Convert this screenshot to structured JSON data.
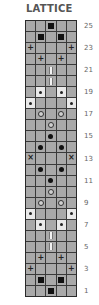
{
  "title": "LATTICE",
  "chart_data": {
    "type": "table",
    "title": "LATTICE",
    "columns": 5,
    "rows": 25,
    "row_order": "top-to-bottom from row 25 to row 1",
    "legend": {
      "square": "filled black square",
      "dot": "small dot on light cell",
      "bigdot": "large black dot",
      "ring": "hollow circle",
      "bar": "vertical bar",
      "plus": "+",
      "cross": "×"
    },
    "grid": [
      {
        "row": 25,
        "cells": [
          "",
          "",
          "square",
          "",
          ""
        ]
      },
      {
        "row": 24,
        "cells": [
          "",
          "square",
          "",
          "square",
          ""
        ]
      },
      {
        "row": 23,
        "cells": [
          "plus",
          "",
          "",
          "",
          "plus"
        ]
      },
      {
        "row": 22,
        "cells": [
          "",
          "plus",
          "",
          "plus",
          ""
        ]
      },
      {
        "row": 21,
        "cells": [
          "",
          "",
          "bar",
          "",
          ""
        ]
      },
      {
        "row": 20,
        "cells": [
          "",
          "",
          "bar",
          "",
          ""
        ]
      },
      {
        "row": 19,
        "cells": [
          "",
          "dot",
          "",
          "dot",
          ""
        ]
      },
      {
        "row": 18,
        "cells": [
          "dot",
          "",
          "",
          "",
          "dot"
        ]
      },
      {
        "row": 17,
        "cells": [
          "",
          "ring",
          "",
          "ring",
          ""
        ]
      },
      {
        "row": 16,
        "cells": [
          "",
          "",
          "ring",
          "",
          ""
        ]
      },
      {
        "row": 15,
        "cells": [
          "",
          "",
          "bigdot",
          "",
          ""
        ]
      },
      {
        "row": 14,
        "cells": [
          "",
          "bigdot",
          "",
          "bigdot",
          ""
        ]
      },
      {
        "row": 13,
        "cells": [
          "cross",
          "",
          "",
          "",
          "cross"
        ]
      },
      {
        "row": 12,
        "cells": [
          "",
          "bigdot",
          "",
          "bigdot",
          ""
        ]
      },
      {
        "row": 11,
        "cells": [
          "",
          "",
          "bigdot",
          "",
          ""
        ]
      },
      {
        "row": 10,
        "cells": [
          "",
          "",
          "ring",
          "",
          ""
        ]
      },
      {
        "row": 9,
        "cells": [
          "",
          "ring",
          "",
          "ring",
          ""
        ]
      },
      {
        "row": 8,
        "cells": [
          "dot",
          "",
          "",
          "",
          "dot"
        ]
      },
      {
        "row": 7,
        "cells": [
          "",
          "dot",
          "",
          "dot",
          ""
        ]
      },
      {
        "row": 6,
        "cells": [
          "",
          "",
          "bar",
          "",
          ""
        ]
      },
      {
        "row": 5,
        "cells": [
          "",
          "",
          "bar",
          "",
          ""
        ]
      },
      {
        "row": 4,
        "cells": [
          "",
          "plus",
          "",
          "plus",
          ""
        ]
      },
      {
        "row": 3,
        "cells": [
          "plus",
          "",
          "",
          "",
          "plus"
        ]
      },
      {
        "row": 2,
        "cells": [
          "",
          "square",
          "",
          "square",
          ""
        ]
      },
      {
        "row": 1,
        "cells": [
          "",
          "",
          "square",
          "",
          ""
        ]
      }
    ],
    "row_labels": [
      "25",
      "23",
      "21",
      "19",
      "17",
      "15",
      "13",
      "11",
      "9",
      "7",
      "5",
      "3",
      "1"
    ]
  },
  "colors": {
    "cell": "#a9a9a9",
    "cell_light": "#e9e9e9",
    "grid_line": "#3a3a3a",
    "symbol": "#111111",
    "title": "#555555",
    "label": "#666666"
  }
}
